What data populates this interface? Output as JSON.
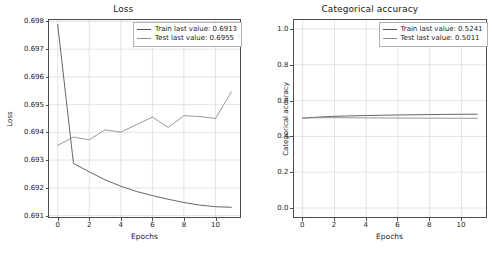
{
  "figure": {
    "background": "#ffffff",
    "train_color": "#555555",
    "test_color": "#8c8c8c"
  },
  "panels": [
    {
      "id": "loss",
      "title": "Loss",
      "xlabel": "Epochs",
      "ylabel": "Loss",
      "yticks": [
        "0.691",
        "0.692",
        "0.693",
        "0.694",
        "0.695",
        "0.696",
        "0.697",
        "0.698"
      ],
      "xticks": [
        "0",
        "2",
        "4",
        "6",
        "8",
        "10"
      ],
      "legend": [
        {
          "label": "Train last value: 0.6913",
          "color": "#555555"
        },
        {
          "label": "Test last value: 0.6955",
          "color": "#8c8c8c"
        }
      ]
    },
    {
      "id": "accuracy",
      "title": "Categorical accuracy",
      "xlabel": "Epochs",
      "ylabel": "Categorical accuracy",
      "yticks": [
        "0.0",
        "0.2",
        "0.4",
        "0.6",
        "0.8",
        "1.0"
      ],
      "xticks": [
        "0",
        "2",
        "4",
        "6",
        "8",
        "10"
      ],
      "legend": [
        {
          "label": "Train last value: 0.5241",
          "color": "#555555"
        },
        {
          "label": "Test last value: 0.5011",
          "color": "#8c8c8c"
        }
      ]
    }
  ],
  "chart_data": [
    {
      "type": "line",
      "title": "Loss",
      "xlabel": "Epochs",
      "ylabel": "Loss",
      "x": [
        0,
        1,
        2,
        3,
        4,
        5,
        6,
        7,
        8,
        9,
        10,
        11
      ],
      "xlim": [
        -0.55,
        11.55
      ],
      "ylim": [
        0.69095,
        0.69805
      ],
      "xticks": [
        0,
        2,
        4,
        6,
        8,
        10
      ],
      "yticks": [
        0.691,
        0.692,
        0.693,
        0.694,
        0.695,
        0.696,
        0.697,
        0.698
      ],
      "grid": true,
      "legend_position": "upper right",
      "series": [
        {
          "name": "Train last value: 0.6913",
          "color": "#555555",
          "values": [
            0.69789,
            0.69288,
            0.69258,
            0.69229,
            0.69206,
            0.69187,
            0.69172,
            0.69159,
            0.69147,
            0.69138,
            0.69132,
            0.6913
          ]
        },
        {
          "name": "Test last value: 0.6955",
          "color": "#8c8c8c",
          "values": [
            0.69353,
            0.69383,
            0.69373,
            0.69409,
            0.69401,
            0.69428,
            0.69455,
            0.69418,
            0.6946,
            0.69457,
            0.6945,
            0.69546
          ]
        }
      ]
    },
    {
      "type": "line",
      "title": "Categorical accuracy",
      "xlabel": "Epochs",
      "ylabel": "Categorical accuracy",
      "x": [
        0,
        1,
        2,
        3,
        4,
        5,
        6,
        7,
        8,
        9,
        10,
        11
      ],
      "xlim": [
        -0.55,
        11.55
      ],
      "ylim": [
        -0.05,
        1.05
      ],
      "xticks": [
        0,
        2,
        4,
        6,
        8,
        10
      ],
      "yticks": [
        0.0,
        0.2,
        0.4,
        0.6,
        0.8,
        1.0
      ],
      "grid": true,
      "legend_position": "upper right",
      "series": [
        {
          "name": "Train last value: 0.5241",
          "color": "#555555",
          "values": [
            0.5022,
            0.508,
            0.5122,
            0.5145,
            0.5165,
            0.5182,
            0.5196,
            0.5208,
            0.522,
            0.5229,
            0.5236,
            0.5241
          ]
        },
        {
          "name": "Test last value: 0.5011",
          "color": "#8c8c8c",
          "values": [
            0.5025,
            0.5042,
            0.5048,
            0.5041,
            0.5035,
            0.503,
            0.5026,
            0.5022,
            0.5019,
            0.5016,
            0.5013,
            0.5011
          ]
        }
      ]
    }
  ]
}
